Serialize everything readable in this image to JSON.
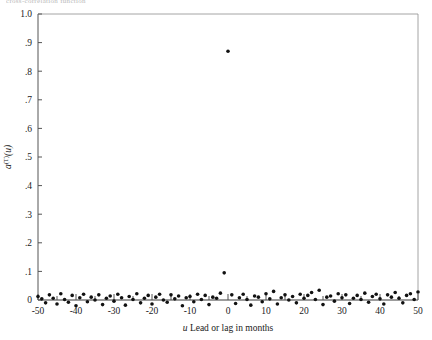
{
  "figure": {
    "clipped_header": "cross-correlation function",
    "background": "#ffffff",
    "point_color": "#111111",
    "axis_color": "#555555"
  },
  "chart_data": {
    "type": "scatter",
    "title": "",
    "xlabel": "u Lead or lag in months",
    "xlabel_italic_prefix": "u",
    "ylabel": "a⁽ᵀ⁾(u)",
    "ylabel_parts": {
      "base": "a",
      "superscript": "(T)",
      "arg": "(u)"
    },
    "xlim": [
      -50,
      50
    ],
    "ylim": [
      0,
      1.0
    ],
    "xticks": [
      -50,
      -40,
      -30,
      -20,
      -10,
      0,
      10,
      20,
      30,
      40,
      50
    ],
    "xtick_labels": [
      "-50",
      "-40",
      "-30",
      "-20",
      "-10",
      "0",
      "10",
      "20",
      "30",
      "40",
      "50"
    ],
    "xminor_step": 5,
    "yticks": [
      0,
      0.1,
      0.2,
      0.3,
      0.4,
      0.5,
      0.6,
      0.7,
      0.8,
      0.9,
      1.0
    ],
    "ytick_labels": [
      "0",
      ".1",
      ".2",
      ".3",
      ".4",
      ".5",
      ".6",
      ".7",
      ".8",
      ".9",
      "1.0"
    ],
    "grid": false,
    "legend": "none",
    "zero_reference_line": 0.0,
    "peak": {
      "x": 0,
      "y": 0.87
    },
    "secondary_peak": {
      "x": -1,
      "y": 0.095
    },
    "x": [
      -50,
      -49,
      -48,
      -47,
      -46,
      -45,
      -44,
      -43,
      -42,
      -41,
      -40,
      -39,
      -38,
      -37,
      -36,
      -35,
      -34,
      -33,
      -32,
      -31,
      -30,
      -29,
      -28,
      -27,
      -26,
      -25,
      -24,
      -23,
      -22,
      -21,
      -20,
      -19,
      -18,
      -17,
      -16,
      -15,
      -14,
      -13,
      -12,
      -11,
      -10,
      -9,
      -8,
      -7,
      -6,
      -5,
      -4,
      -3,
      -2,
      -1,
      0,
      1,
      2,
      3,
      4,
      5,
      6,
      7,
      8,
      9,
      10,
      11,
      12,
      13,
      14,
      15,
      16,
      17,
      18,
      19,
      20,
      21,
      22,
      23,
      24,
      25,
      26,
      27,
      28,
      29,
      30,
      31,
      32,
      33,
      34,
      35,
      36,
      37,
      38,
      39,
      40,
      41,
      42,
      43,
      44,
      45,
      46,
      47,
      48,
      49,
      50
    ],
    "y": [
      0.012,
      0.004,
      -0.01,
      0.018,
      0.006,
      -0.014,
      0.022,
      0.002,
      -0.008,
      0.016,
      -0.02,
      0.008,
      0.02,
      -0.006,
      0.01,
      0.0,
      0.018,
      -0.016,
      0.006,
      0.014,
      -0.004,
      0.02,
      0.008,
      -0.018,
      0.012,
      0.002,
      0.022,
      -0.01,
      0.006,
      0.016,
      -0.014,
      0.01,
      0.02,
      0.0,
      -0.008,
      0.018,
      0.004,
      0.014,
      -0.02,
      0.008,
      0.012,
      -0.006,
      0.02,
      0.002,
      0.016,
      -0.016,
      0.01,
      0.006,
      0.024,
      0.095,
      0.87,
      0.018,
      -0.012,
      0.008,
      0.02,
      0.002,
      -0.018,
      0.014,
      0.01,
      -0.006,
      0.022,
      0.004,
      0.03,
      -0.014,
      0.008,
      0.018,
      0.0,
      0.012,
      -0.01,
      0.02,
      0.006,
      0.016,
      0.026,
      0.002,
      0.034,
      -0.016,
      0.01,
      0.014,
      -0.004,
      0.022,
      0.008,
      0.018,
      -0.012,
      0.006,
      0.016,
      0.002,
      0.024,
      -0.008,
      0.012,
      0.02,
      0.004,
      -0.014,
      0.018,
      0.01,
      0.026,
      0.006,
      -0.01,
      0.016,
      0.022,
      0.002,
      0.028
    ]
  }
}
